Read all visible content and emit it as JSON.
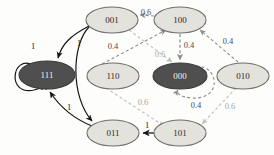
{
  "diagram": {
    "title_text": "",
    "type": "state-transition-graph",
    "canvas": {
      "width": 274,
      "height": 155,
      "background": "#fdfdfc"
    },
    "palette": {
      "node_light_fill": "#e3e2dd",
      "node_dark_fill": "#4f4f4f",
      "node_stroke": "#6f6e6a",
      "node_dark_stroke": "#3a3a3a",
      "label_light": "#2b2b2b",
      "label_dark": "#efeeec",
      "edge_solid": "#161616",
      "edge_dash_dark": "#8d8d8d",
      "edge_dash_light": "#bfbfbf"
    },
    "nodes": [
      {
        "id": "001",
        "label": "001",
        "cx": 112,
        "cy": 20,
        "rx": 26,
        "ry": 13,
        "style": "light"
      },
      {
        "id": "100",
        "label": "100",
        "cx": 180,
        "cy": 20,
        "rx": 26,
        "ry": 13,
        "style": "light"
      },
      {
        "id": "111",
        "label": "111",
        "cx": 47,
        "cy": 75,
        "rx": 28,
        "ry": 14,
        "style": "dark"
      },
      {
        "id": "110",
        "label": "110",
        "cx": 113,
        "cy": 76,
        "rx": 26,
        "ry": 13,
        "style": "light"
      },
      {
        "id": "000",
        "label": "000",
        "cx": 180,
        "cy": 76,
        "rx": 27,
        "ry": 13,
        "style": "dark"
      },
      {
        "id": "010",
        "label": "010",
        "cx": 243,
        "cy": 76,
        "rx": 26,
        "ry": 13,
        "style": "light"
      },
      {
        "id": "011",
        "label": "011",
        "cx": 113,
        "cy": 133,
        "rx": 26,
        "ry": 13,
        "style": "light"
      },
      {
        "id": "101",
        "label": "101",
        "cx": 180,
        "cy": 133,
        "rx": 26,
        "ry": 13,
        "style": "light"
      }
    ],
    "edges": [
      {
        "id": "e-111-111",
        "from": "111",
        "to": "111",
        "weight": "1",
        "kind": "solid",
        "label_x": 33,
        "label_y": 47
      },
      {
        "id": "e-001-111",
        "from": "001",
        "to": "111",
        "weight": "1",
        "kind": "solid",
        "label_x": 79,
        "label_y": 44
      },
      {
        "id": "e-011-111",
        "from": "011",
        "to": "111",
        "weight": "1",
        "kind": "solid",
        "label_x": 69,
        "label_y": 108
      },
      {
        "id": "e-001-011",
        "from": "001",
        "to": "011",
        "weight": "",
        "kind": "solid",
        "label_x": 0,
        "label_y": 0
      },
      {
        "id": "e-101-011",
        "from": "101",
        "to": "011",
        "weight": "1",
        "kind": "solid",
        "label_x": 147,
        "label_y": 126
      },
      {
        "id": "e-100-001",
        "from": "100",
        "to": "001",
        "weight": "0.6",
        "kind": "dash-dark",
        "label_x": 146,
        "label_y": 13
      },
      {
        "id": "e-110-100",
        "from": "110",
        "to": "100",
        "weight": "0.4",
        "kind": "dash-dark",
        "label_x": 113,
        "label_y": 47
      },
      {
        "id": "e-100-000",
        "from": "100",
        "to": "000",
        "weight": "0.4",
        "kind": "dash-dark",
        "label_x": 189,
        "label_y": 46
      },
      {
        "id": "e-001-000",
        "from": "001",
        "to": "000",
        "weight": "0.6",
        "kind": "dash-light",
        "label_x": 160,
        "label_y": 55
      },
      {
        "id": "e-000-000",
        "from": "000",
        "to": "000",
        "weight": "0.4",
        "kind": "dash-dark",
        "label_x": 196,
        "label_y": 106
      },
      {
        "id": "e-010-100",
        "from": "010",
        "to": "100",
        "weight": "0.4",
        "kind": "dash-dark",
        "label_x": 228,
        "label_y": 42
      },
      {
        "id": "e-110-101",
        "from": "110",
        "to": "101",
        "weight": "0.6",
        "kind": "dash-light",
        "label_x": 143,
        "label_y": 103
      },
      {
        "id": "e-010-101",
        "from": "010",
        "to": "101",
        "weight": "0.6",
        "kind": "dash-light",
        "label_x": 230,
        "label_y": 107
      }
    ]
  }
}
